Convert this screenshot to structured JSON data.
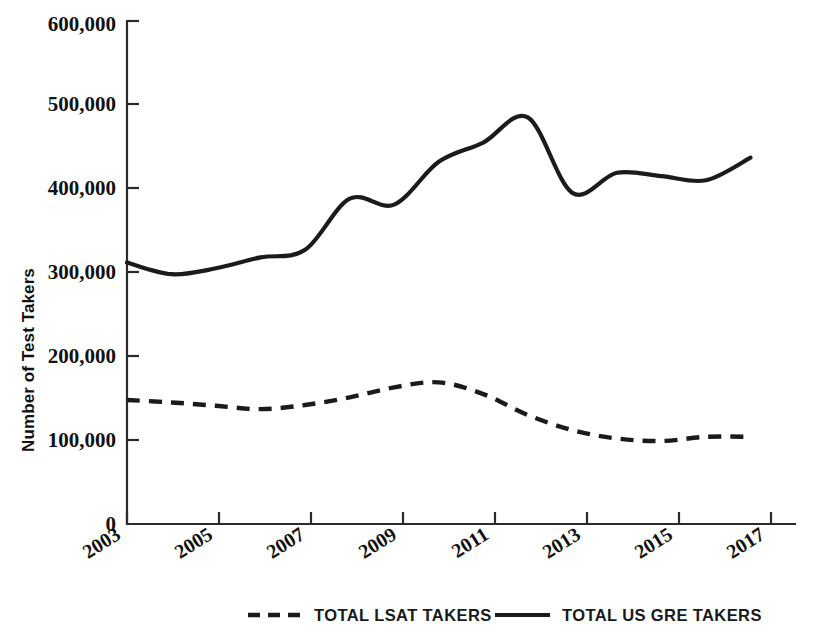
{
  "chart_data": {
    "type": "line",
    "title": "",
    "xlabel": "",
    "ylabel": "Number of Test Takers",
    "x": [
      2003,
      2004,
      2005,
      2006,
      2007,
      2008,
      2009,
      2010,
      2011,
      2012,
      2013,
      2014,
      2015,
      2016,
      2017
    ],
    "xlim": [
      2003,
      2018
    ],
    "ylim": [
      0,
      600000
    ],
    "x_tick_labels": [
      "2003",
      "2005",
      "2007",
      "2009",
      "2011",
      "2013",
      "2015",
      "2017"
    ],
    "x_tick_values": [
      2003,
      2005,
      2007,
      2009,
      2011,
      2013,
      2015,
      2017
    ],
    "y_tick_labels": [
      "0",
      "100,000",
      "200,000",
      "300,000",
      "400,000",
      "500,000",
      "600,000"
    ],
    "y_tick_values": [
      0,
      100000,
      200000,
      300000,
      400000,
      500000,
      600000
    ],
    "grid": false,
    "legend_position": "bottom",
    "series": [
      {
        "name": "TOTAL LSAT TAKERS",
        "style": "dashed",
        "color": "#1b1b1b",
        "values": [
          148000,
          145000,
          141000,
          137000,
          142000,
          151000,
          163000,
          169000,
          155000,
          130000,
          112000,
          102000,
          99000,
          104000,
          104000
        ]
      },
      {
        "name": "TOTAL US GRE TAKERS",
        "style": "solid",
        "color": "#1b1b1b",
        "values": [
          312000,
          298000,
          305000,
          318000,
          327000,
          388000,
          381000,
          432000,
          455000,
          485000,
          395000,
          419000,
          415000,
          410000,
          437000
        ]
      }
    ]
  },
  "axes": {
    "y_title": "Number of Test Takers"
  },
  "legend": {
    "items": [
      {
        "label": "TOTAL LSAT TAKERS",
        "style": "dashed"
      },
      {
        "label": "TOTAL US GRE TAKERS",
        "style": "solid"
      }
    ]
  },
  "colors": {
    "line": "#1b1b1b",
    "axis": "#2b2b2b",
    "background": "#ffffff"
  }
}
